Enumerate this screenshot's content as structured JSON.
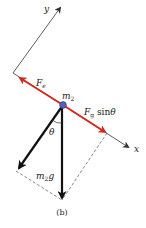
{
  "diagram": {
    "caption": "(b)",
    "axes": {
      "x_label": "x",
      "y_label": "y"
    },
    "mass": {
      "label_base": "m",
      "label_sub": "2"
    },
    "forces": {
      "electric": {
        "label_base": "F",
        "label_sub": "e",
        "color": "#d42a1e"
      },
      "gravity_component": {
        "label_base": "F",
        "label_sub": "g",
        "label_suffix": " sin",
        "label_angle": "θ",
        "color": "#d42a1e"
      },
      "weight": {
        "label_base": "m",
        "label_sub": "2",
        "label_suffix": "g",
        "color": "#111111"
      }
    },
    "angle_label": "θ",
    "colors": {
      "red_arrow": "#d42a1e",
      "mass_dot": "#5a5fb8",
      "black_arrow": "#111111",
      "axis": "#333333",
      "dashed": "#555555"
    }
  }
}
